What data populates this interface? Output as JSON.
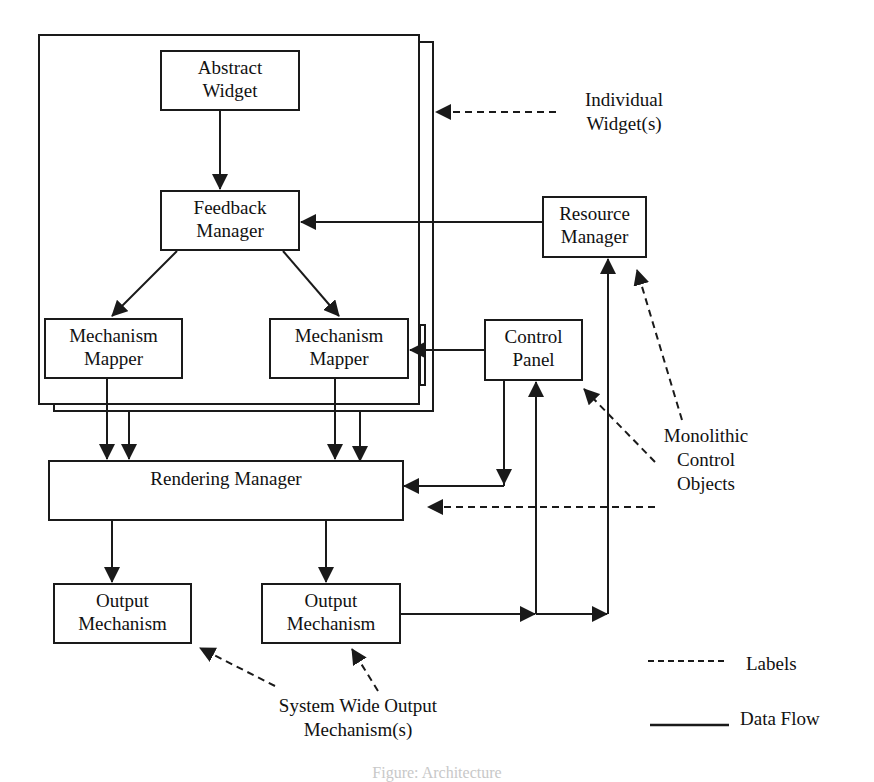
{
  "nodes": {
    "abstract_widget": {
      "line1": "Abstract",
      "line2": "Widget"
    },
    "feedback_manager": {
      "line1": "Feedback",
      "line2": "Manager"
    },
    "mechanism_mapper_left": {
      "line1": "Mechanism",
      "line2": "Mapper"
    },
    "mechanism_mapper_right": {
      "line1": "Mechanism",
      "line2": "Mapper"
    },
    "resource_manager": {
      "line1": "Resource",
      "line2": "Manager"
    },
    "control_panel": {
      "line1": "Control",
      "line2": "Panel"
    },
    "rendering_manager": {
      "line1": "Rendering Manager"
    },
    "output_mechanism_left": {
      "line1": "Output",
      "line2": "Mechanism"
    },
    "output_mechanism_right": {
      "line1": "Output",
      "line2": "Mechanism"
    }
  },
  "annotations": {
    "individual_widgets": {
      "line1": "Individual",
      "line2": "Widget(s)"
    },
    "monolithic_control_objects": {
      "line1": "Monolithic",
      "line2": "Control",
      "line3": "Objects"
    },
    "system_wide_output": {
      "line1": "System Wide Output",
      "line2": "Mechanism(s)"
    }
  },
  "legend": {
    "dashed_label": "Labels",
    "solid_label": "Data Flow"
  },
  "colors": {
    "stroke": "#1a1a1a",
    "background": "#ffffff"
  },
  "caption": "Figure: Architecture"
}
